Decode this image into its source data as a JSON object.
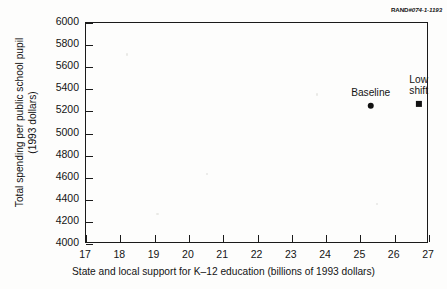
{
  "credit": {
    "mark": "RAND",
    "number": "#074-1-1193"
  },
  "chart_data": {
    "type": "scatter",
    "title": "",
    "subtitle": "",
    "xlabel": "State and local support for K–12 education (billions of 1993 dollars)",
    "ylabel_line1": "Total spending per public school pupil",
    "ylabel_line2": "(1993 dollars)",
    "ylabel": "Total spending per public school pupil (1993 dollars)",
    "xlim": [
      17,
      27
    ],
    "ylim": [
      4000,
      6000
    ],
    "xticks": [
      17,
      18,
      19,
      20,
      21,
      22,
      23,
      24,
      25,
      26,
      27
    ],
    "yticks": [
      4000,
      4200,
      4400,
      4600,
      4800,
      5000,
      5200,
      5400,
      5600,
      5800,
      6000
    ],
    "xtick_labels": [
      "17",
      "18",
      "19",
      "20",
      "21",
      "22",
      "23",
      "24",
      "25",
      "26",
      "27"
    ],
    "ytick_labels": [
      "4000",
      "4200",
      "4400",
      "4600",
      "4800",
      "5000",
      "5200",
      "5400",
      "5600",
      "5800",
      "6000"
    ],
    "grid": false,
    "legend": "none",
    "tick_direction": "in",
    "points": [
      {
        "name": "Baseline",
        "label_lines": [
          "Baseline"
        ],
        "x": 25.3,
        "y": 5250,
        "marker": "circle",
        "color": "#111111"
      },
      {
        "name": "Low shift",
        "label_lines": [
          "Low",
          "shift"
        ],
        "x": 26.7,
        "y": 5270,
        "marker": "square",
        "color": "#111111"
      }
    ],
    "colors": {
      "axis": "#1a1a1a",
      "text": "#141414",
      "marker": "#111111",
      "background": "#fdfdfc"
    }
  }
}
